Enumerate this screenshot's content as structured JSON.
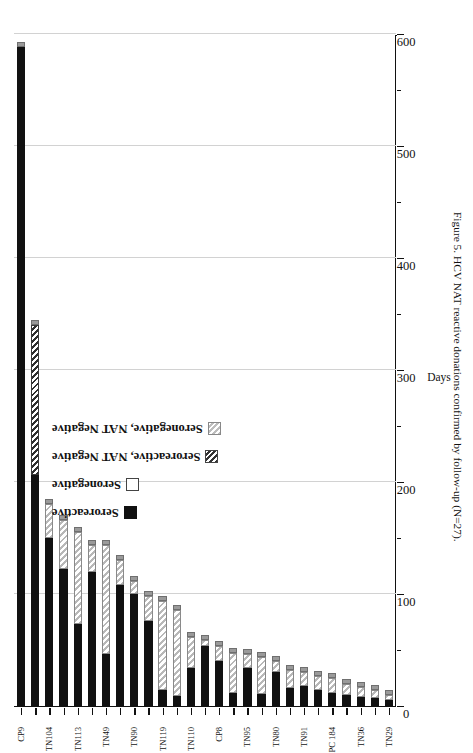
{
  "figure": {
    "caption": "Figure 5. HCV NAT reactive donations confirmed by follow-up (N=27).",
    "axis_title": "Days"
  },
  "legend": {
    "items": [
      {
        "label": "Seroreactive",
        "swatch": "solid-black-swatch"
      },
      {
        "label": "Seronegative",
        "swatch": "open-white-swatch"
      },
      {
        "label": "Seroreactive, NAT Negative",
        "swatch": "dark-hatch-swatch"
      },
      {
        "label": "Seronegative, NAT Negative",
        "swatch": "light-hatch-swatch"
      }
    ]
  },
  "chart_data": {
    "type": "bar",
    "orientation": "horizontal-stacked",
    "title": "Figure 5. HCV NAT reactive donations confirmed by follow-up (N=27)",
    "xlabel": "Days",
    "ylabel": "",
    "xlim": [
      0,
      600
    ],
    "xticks": [
      0,
      100,
      200,
      300,
      400,
      500,
      600
    ],
    "xminorticks": [
      50,
      150,
      250,
      350,
      450,
      550
    ],
    "grid": "vertical-at-major-ticks",
    "legend_position": "inside-upper-left",
    "categories": [
      "TN29",
      "TN33",
      "TN36",
      "TN41",
      "PC 184",
      "TN73",
      "TN91",
      "TN55",
      "TN80",
      "TN66",
      "TN95",
      "TN61",
      "CP8",
      "TN77",
      "TN110",
      "TN88",
      "TN119",
      "TN102",
      "TN90",
      "TN47",
      "TN49",
      "TN58",
      "TN113",
      "TN70",
      "TN104",
      "TN97",
      "CP9"
    ],
    "labeled_categories": [
      "TN29",
      "TN36",
      "PC 184",
      "TN91",
      "TN80",
      "TN95",
      "CP8",
      "TN110",
      "TN119",
      "TN90",
      "TN49",
      "TN113",
      "TN104",
      "CP9"
    ],
    "series": [
      {
        "name": "Seroreactive",
        "values": [
          5,
          7,
          8,
          10,
          12,
          14,
          18,
          16,
          30,
          11,
          34,
          12,
          40,
          54,
          34,
          9,
          14,
          76,
          100,
          108,
          46,
          120,
          73,
          122,
          150,
          206,
          588
        ]
      },
      {
        "name": "Seronegative",
        "values": [
          0,
          0,
          0,
          0,
          0,
          0,
          0,
          0,
          0,
          0,
          0,
          0,
          0,
          0,
          0,
          0,
          0,
          0,
          0,
          0,
          0,
          0,
          0,
          0,
          0,
          0,
          0
        ]
      },
      {
        "name": "Seroreactive, NAT Negative",
        "values": [
          0,
          0,
          0,
          0,
          0,
          0,
          0,
          0,
          0,
          0,
          0,
          0,
          0,
          0,
          0,
          0,
          0,
          0,
          0,
          0,
          0,
          0,
          0,
          0,
          0,
          134,
          0
        ]
      },
      {
        "name": "Seronegative, NAT Negative",
        "values": [
          5,
          7,
          9,
          10,
          13,
          13,
          12,
          16,
          10,
          33,
          12,
          35,
          14,
          5,
          28,
          77,
          80,
          22,
          12,
          22,
          98,
          24,
          82,
          44,
          30,
          0,
          0
        ]
      }
    ],
    "totals": [
      10,
      14,
      17,
      20,
      25,
      27,
      30,
      32,
      40,
      44,
      46,
      47,
      54,
      59,
      62,
      86,
      94,
      98,
      112,
      130,
      144,
      144,
      155,
      166,
      180,
      340,
      588
    ]
  }
}
